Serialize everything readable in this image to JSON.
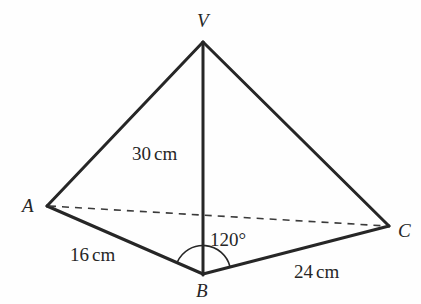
{
  "figure": {
    "kind": "geometry-diagram",
    "background_color": "#fefefe",
    "stroke_color": "#262626",
    "solid_stroke_width": 3,
    "dashed_stroke_width": 1.6,
    "arc_stroke_width": 1.6,
    "vertices": [
      {
        "id": "V",
        "label": "V",
        "x": 203,
        "y": 42
      },
      {
        "id": "A",
        "label": "A",
        "x": 47,
        "y": 206
      },
      {
        "id": "B",
        "label": "B",
        "x": 203,
        "y": 273
      },
      {
        "id": "C",
        "label": "C",
        "x": 389,
        "y": 226
      }
    ],
    "solid_edges": [
      {
        "name": "edge-VA",
        "from": "V",
        "to": "A"
      },
      {
        "name": "edge-VB",
        "from": "V",
        "to": "B"
      },
      {
        "name": "edge-VC",
        "from": "V",
        "to": "C"
      },
      {
        "name": "edge-AB",
        "from": "A",
        "to": "B"
      },
      {
        "name": "edge-BC",
        "from": "B",
        "to": "C"
      }
    ],
    "dashed_edges": [
      {
        "name": "edge-AC",
        "from": "A",
        "to": "C"
      }
    ],
    "angle_arc": {
      "name": "angle-arc-ABC",
      "center": "B",
      "radius": 28,
      "value": "120°"
    },
    "measurements": {
      "height_vb": "30 cm",
      "side_ab": "16 cm",
      "side_bc": "24 cm",
      "angle_abc": "120°"
    },
    "measurement_parts": {
      "height_number": "30",
      "height_unit": "cm",
      "ab_number": "16",
      "ab_unit": "cm",
      "bc_number": "24",
      "bc_unit": "cm"
    }
  }
}
